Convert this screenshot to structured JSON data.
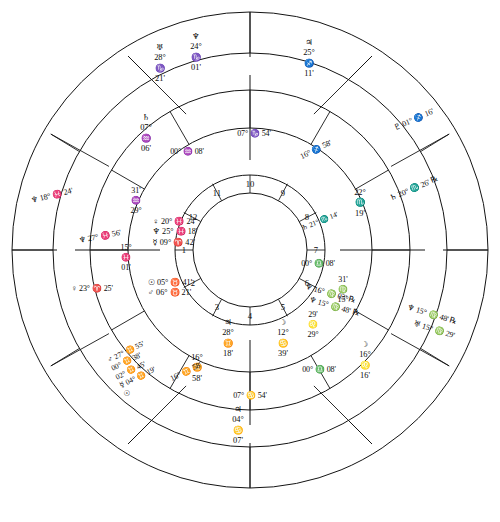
{
  "chart": {
    "type": "astrological-natal-wheel",
    "rings": [
      "outer-transit-ring",
      "middle-progressed-ring",
      "inner-natal-ring",
      "house-number-ring"
    ],
    "house_numbers": [
      "1",
      "2",
      "3",
      "4",
      "5",
      "6",
      "7",
      "8",
      "9",
      "10",
      "11",
      "12"
    ],
    "cusps": {
      "mc": "07° ♑ 54'",
      "ic": "07° ♋ 54'",
      "asc": "09° ♈ 42'",
      "desc": "00° ♎ 08'",
      "c11": "16° ♐ 58'",
      "c12": "15° ♓ 01'",
      "c2": "16° ♊ 58'",
      "c3": "15° ♍ 31'",
      "c5": "00° ♑ 08'",
      "c6": "29° ♑ 31'",
      "c8": "29° ♌ 29'",
      "c9": "16° ♊ 16'"
    },
    "outer_ring_bodies": [
      {
        "label_lines": [
          "♅",
          "28°",
          "♑",
          "21'"
        ],
        "planet": "Uranus",
        "deg": "28°",
        "sign": "♑",
        "min": "21'"
      },
      {
        "label_lines": [
          "♆",
          "24°",
          "♑",
          "01'"
        ],
        "planet": "Neptune",
        "deg": "24°",
        "sign": "♑",
        "min": "01'"
      },
      {
        "label_lines": [
          "♃",
          "25°",
          "♐",
          "11'"
        ],
        "planet": "Jupiter",
        "deg": "25°",
        "sign": "♐",
        "min": "11'"
      },
      {
        "label_lines": [
          "♇",
          "01°",
          "♐",
          "16'"
        ],
        "planet": "Pluto",
        "deg": "01°",
        "sign": "♐",
        "min": "16'"
      },
      {
        "label_lines": [
          "♄",
          "20°",
          "♏",
          "26'",
          "℞"
        ],
        "planet": "Saturn",
        "deg": "20°",
        "sign": "♏",
        "min": "26'",
        "retro": "℞"
      },
      {
        "label_lines": [
          "♆",
          "15°",
          "♍",
          "48'",
          "℞"
        ],
        "planet": "Neptune",
        "deg": "15°",
        "sign": "♍",
        "min": "48'",
        "retro": "℞"
      },
      {
        "label_lines": [
          "♅",
          "15°",
          "♍",
          "29'"
        ],
        "planet": "Uranus",
        "deg": "15°",
        "sign": "♍",
        "min": "29'"
      },
      {
        "label_lines": [
          "☽",
          "16°",
          "♌",
          "16'"
        ],
        "planet": "Moon",
        "deg": "16°",
        "sign": "♌",
        "min": "16'"
      },
      {
        "label_lines": [
          "♃",
          "04°",
          "♋",
          "07'"
        ],
        "planet": "Jupiter",
        "deg": "04°",
        "sign": "♋",
        "min": "07'"
      },
      {
        "label_lines": [
          "♃",
          "28°",
          "♊",
          "18'"
        ],
        "planet": "Jupiter",
        "deg": "28°",
        "sign": "♊",
        "min": "18'"
      },
      {
        "label_lines": [
          "☽",
          "12°",
          "♋",
          "39'"
        ],
        "planet": "Moon",
        "deg": "12°",
        "sign": "♋",
        "min": "39'"
      },
      {
        "label_lines": [
          "♀",
          "23°",
          "♈",
          "25'"
        ],
        "planet": "Venus",
        "deg": "23°",
        "sign": "♈",
        "min": "25'"
      },
      {
        "label_lines": [
          "♆",
          "18°",
          "♓",
          "24'"
        ],
        "planet": "Neptune",
        "deg": "18°",
        "sign": "♓",
        "min": "24'"
      },
      {
        "label_lines": [
          "♄",
          "07°",
          "♒",
          "06'"
        ],
        "planet": "Saturn",
        "deg": "07°",
        "sign": "♒",
        "min": "06'"
      }
    ],
    "middle_ring_bodies": [
      {
        "text": "♆ 27° ♓ 56'",
        "planet": "Neptune"
      },
      {
        "text": "♆ 15° ♍ 48' ℞",
        "planet": "Neptune"
      },
      {
        "text": "♆ 16° ♍ 03' ℞",
        "planet": "Neptune"
      },
      {
        "text": "♄ 22° ♏ 19'",
        "planet": "Saturn"
      },
      {
        "text": "♃ 16° ♊ 58'",
        "planet": "Jupiter"
      },
      {
        "text": "00° ♒ 08'",
        "planet": "cusp"
      },
      {
        "text": "00° ♎ 08'",
        "planet": "cusp"
      }
    ],
    "inner_cluster_left": [
      "♀ 20° ♓ 24'",
      "♆ 25° ♓ 18'",
      "☿ 09° ♈ 42'"
    ],
    "inner_cluster_lower_left": [
      "☉ 05° ♉ 41'",
      "♂ 06° ♉ 21'"
    ],
    "inner_cluster_bottom": [
      "♂ 27° ♊ 55'",
      "00° ♊ 38'",
      "02° ♊ 45'",
      "☿ 04° ♊ 19'",
      "☉"
    ],
    "inner_cluster_right": [
      "♄ 21° ♏ 14'",
      "♆ 15° ♍ 03'"
    ],
    "colors": {
      "line": "#1a1a1a",
      "text": "#0a0a0a",
      "background": "#ffffff"
    }
  },
  "labels": {
    "mc": "07° ♑ 54'",
    "ic": "07° ♋ 54'",
    "asc_deg": "09°",
    "asc_sign": "♈",
    "asc_min": "42'",
    "desc": "00° ♎ 08'",
    "c5": "00° ♒ 08'",
    "c11_a": "16°",
    "c11_b": "58'",
    "c11_sign": "♐",
    "c2_a": "16°",
    "c2_b": "58'",
    "c2_sign": "♊",
    "c12_deg": "15°",
    "c12_sign": "♓",
    "c12_min": "01'",
    "c3_deg": "15°",
    "c3_sign": "♍",
    "c3_min": "31'",
    "c6_deg": "29°",
    "c6_sign": "♒",
    "c6_min": "31'",
    "c9_deg": "29°",
    "c9_sign": "♌",
    "c9_min": "29'",
    "saturn_outer": "♄",
    "saturn_out_deg": "20°",
    "saturn_out_sign": "♏",
    "saturn_out_min": "26'",
    "saturn_out_rx": "℞"
  },
  "houses": {
    "h1": "1",
    "h2": "2",
    "h3": "3",
    "h4": "4",
    "h5": "5",
    "h6": "6",
    "h7": "7",
    "h8": "8",
    "h9": "9",
    "h10": "10",
    "h11": "11",
    "h12": "12"
  },
  "outer": {
    "uranus_glyph": "♅",
    "uranus_deg": "28°",
    "uranus_sign": "♑",
    "uranus_min": "21'",
    "neptune_glyph": "♆",
    "neptune_deg": "24°",
    "neptune_sign": "♑",
    "neptune_min": "01'",
    "jupiter_glyph": "♃",
    "jupiter_deg": "25°",
    "jupiter_sign": "♐",
    "jupiter_min": "11'",
    "pluto_text": "♇ 01° ♐ 16'",
    "saturn_text": "♄ 20° ♏ 26' ℞",
    "nept_vir_1": "♆ 15° ♍ 48' ℞",
    "uran_vir_1": "♅ 15° ♍ 29'",
    "moon_leo_glyph": "☽",
    "moon_leo_deg": "16°",
    "moon_leo_sign": "♌",
    "moon_leo_min": "16'",
    "jup_can_glyph": "♃",
    "jup_can_deg": "04°",
    "jup_can_sign": "♋",
    "jup_can_min": "07'",
    "jup_gem_glyph": "♃",
    "jup_gem_deg": "28°",
    "jup_gem_sign": "♊",
    "jup_gem_min": "18'",
    "moon_can_glyph": "☽",
    "moon_can_deg": "12°",
    "moon_can_sign": "♋",
    "moon_can_min": "39'",
    "venus_ari": "♀ 23° ♈ 25'",
    "nept_pis": "♆ 18° ♓ 24'",
    "saturn_aqu_glyph": "♄",
    "saturn_aqu_deg": "07°",
    "saturn_aqu_sign": "♒",
    "saturn_aqu_min": "06'"
  },
  "middle": {
    "nept_pis2": "♆ 27° ♓ 56'",
    "nept_vir2": "♆ 16° ♍ 03' ℞",
    "nept_vir3": "♆ 15° ♍ 48' ℞",
    "saturn_sco_deg": "22°",
    "saturn_sco_glyph": "♏",
    "saturn_sco_min": "19'",
    "jup_gem2_deg": "16°",
    "jup_gem2_glyph": "♊",
    "jup_gem2_min": "58'"
  },
  "inner": {
    "venus_pis": "♀ 20° ♓ 24'",
    "nept_pis3": "♆ 25° ♓ 18'",
    "merc_ari": "☿ 09° ♈ 42'",
    "sun_tau": "☉ 05° ♉ 41'",
    "mars_tau": "♂ 06° ♉ 21'",
    "mars_gem": "♂ 27° ♊ 55'",
    "gem_00": "00° ♊ 38'",
    "gem_02": "02° ♊ 45'",
    "merc_gem": "☿ 04° ♊ 19'",
    "sun_glyph": "☉",
    "saturn_sco_in": "♄ 21° ♏ 14'",
    "nept_vir_in": "♆ 15° ♍ 03'"
  }
}
